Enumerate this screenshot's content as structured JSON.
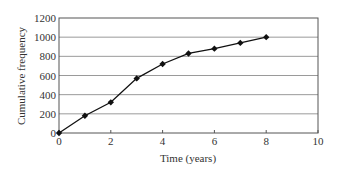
{
  "chart_data": {
    "type": "line",
    "title": "",
    "xlabel": "Time (years)",
    "ylabel": "Cumulative frequency",
    "xlim": [
      0,
      10
    ],
    "ylim": [
      0,
      1200
    ],
    "x_ticks": [
      0,
      2,
      4,
      6,
      8,
      10
    ],
    "y_ticks": [
      0,
      200,
      400,
      600,
      800,
      1000,
      1200
    ],
    "grid": {
      "horizontal": true,
      "vertical": false
    },
    "legend": null,
    "series": [
      {
        "name": "Cumulative frequency",
        "marker": "diamond",
        "color": "#111111",
        "x": [
          0,
          1,
          2,
          3,
          4,
          5,
          6,
          7,
          8
        ],
        "values": [
          0,
          180,
          320,
          570,
          720,
          830,
          880,
          940,
          1000
        ]
      }
    ]
  },
  "colors": {
    "line": "#111111",
    "grid": "#9a9a9a",
    "frame": "#555555"
  }
}
